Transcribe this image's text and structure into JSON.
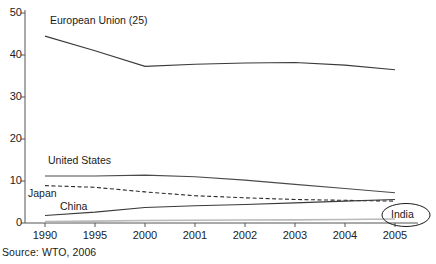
{
  "chart_data": {
    "type": "line",
    "title": "",
    "subtitle": "",
    "xlabel": "",
    "ylabel": "",
    "source": "Source: WTO, 2006",
    "grid": false,
    "legend_position": "inline-labels",
    "x": [
      "1990",
      "1995",
      "2000",
      "2001",
      "2002",
      "2003",
      "2004",
      "2005"
    ],
    "xlim": [
      0,
      7
    ],
    "ylim": [
      0,
      50
    ],
    "yticks": [
      "0",
      "10",
      "20",
      "30",
      "40",
      "50"
    ],
    "xticks": [
      "1990",
      "1995",
      "2000",
      "2001",
      "2002",
      "2003",
      "2004",
      "2005"
    ],
    "series": [
      {
        "name": "European Union (25)",
        "style": "solid",
        "color": "#3a3a3a",
        "label_text": "European Union (25)",
        "values": [
          44.5,
          41.0,
          37.3,
          37.8,
          38.1,
          38.2,
          37.6,
          36.5
        ]
      },
      {
        "name": "United States",
        "style": "solid",
        "color": "#4a4a4a",
        "label_text": "United States",
        "values": [
          11.2,
          11.2,
          11.4,
          11.0,
          10.2,
          9.2,
          8.2,
          7.2
        ]
      },
      {
        "name": "Japan",
        "style": "dashed",
        "color": "#2b2b2b",
        "label_text": "Japan",
        "values": [
          8.9,
          8.5,
          7.4,
          6.5,
          6.0,
          5.6,
          5.4,
          5.2
        ]
      },
      {
        "name": "China",
        "style": "solid",
        "color": "#3a3a3a",
        "label_text": "China",
        "values": [
          1.8,
          2.6,
          3.7,
          4.1,
          4.4,
          4.8,
          5.2,
          5.6
        ]
      },
      {
        "name": "India",
        "style": "solid",
        "color": "#b9b9b9",
        "label_text": "India",
        "values": [
          0.35,
          0.45,
          0.6,
          0.65,
          0.7,
          0.75,
          0.85,
          0.95
        ]
      }
    ]
  },
  "axis": {
    "y_ticks": [
      {
        "label": "50",
        "value": 50
      },
      {
        "label": "40",
        "value": 40
      },
      {
        "label": "30",
        "value": 30
      },
      {
        "label": "20",
        "value": 20
      },
      {
        "label": "10",
        "value": 10
      },
      {
        "label": "0",
        "value": 0
      }
    ],
    "x_ticks": [
      {
        "label": "1990",
        "index": 0
      },
      {
        "label": "1995",
        "index": 1
      },
      {
        "label": "2000",
        "index": 2
      },
      {
        "label": "2001",
        "index": 3
      },
      {
        "label": "2002",
        "index": 4
      },
      {
        "label": "2003",
        "index": 5
      },
      {
        "label": "2004",
        "index": 6
      },
      {
        "label": "2005",
        "index": 7
      }
    ]
  },
  "annotations": {
    "eu_label": "European Union (25)",
    "us_label": "United States",
    "japan_label": "Japan",
    "china_label": "China",
    "india_label": "India"
  },
  "footer": {
    "source": "Source: WTO, 2006"
  }
}
